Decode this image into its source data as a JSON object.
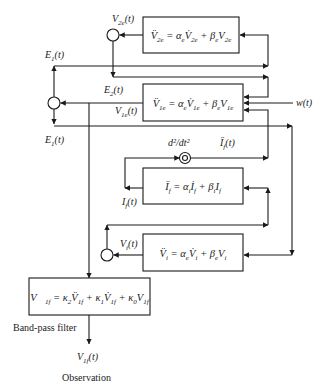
{
  "diagram": {
    "colors": {
      "line": "#1a1a1a",
      "background": "#ffffff"
    },
    "blocks": {
      "v2e": {
        "equation": [
          [
            "V̈",
            "2e"
          ],
          [
            " = α",
            "e"
          ],
          [
            "V̇",
            "2e"
          ],
          [
            " + β",
            "e"
          ],
          [
            "V",
            "2e"
          ]
        ]
      },
      "v1e": {
        "equation": [
          [
            "V̈",
            "1e"
          ],
          [
            " = α",
            "e"
          ],
          [
            "V̇",
            "1e"
          ],
          [
            " + β",
            "e"
          ],
          [
            "V",
            "1e"
          ]
        ]
      },
      "if": {
        "equation": [
          [
            "Ï",
            "f"
          ],
          [
            " = α",
            "i"
          ],
          [
            "İ",
            "f"
          ],
          [
            " + β",
            "i"
          ],
          [
            "I",
            "f"
          ]
        ]
      },
      "vi": {
        "equation": [
          [
            "V̈",
            "i"
          ],
          [
            " = α",
            "e"
          ],
          [
            "V̇",
            "i"
          ],
          [
            " + β",
            "e"
          ],
          [
            "V",
            "i"
          ]
        ]
      },
      "filter": {
        "equation": [
          [
            "V⃛",
            "1f"
          ],
          [
            " = κ",
            "2"
          ],
          [
            "V̈",
            "1f"
          ],
          [
            " + κ",
            "1"
          ],
          [
            "V̇",
            "1f"
          ],
          [
            " + κ",
            "0"
          ],
          [
            "V",
            "1f"
          ]
        ]
      }
    },
    "labels": {
      "v2e_out": [
        [
          "V",
          "2e"
        ],
        [
          "(t)",
          ""
        ]
      ],
      "e1_top": [
        [
          "E",
          "1"
        ],
        [
          "(t)",
          ""
        ]
      ],
      "e2": [
        [
          "E",
          "2"
        ],
        [
          "(t)",
          ""
        ]
      ],
      "v1e_out": [
        [
          "V",
          "1e"
        ],
        [
          "(t)",
          ""
        ]
      ],
      "e1_bottom": [
        [
          "E",
          "1"
        ],
        [
          "(t)",
          ""
        ]
      ],
      "d2dt2": "d²/dt²",
      "if_ddot": [
        [
          "Ï",
          "f"
        ],
        [
          "(t)",
          ""
        ]
      ],
      "if_out": [
        [
          "I",
          "f"
        ],
        [
          "(t)",
          ""
        ]
      ],
      "vi_out": [
        [
          "V",
          "i"
        ],
        [
          "(t)",
          ""
        ]
      ],
      "w": "w(t)",
      "band_pass": "Band-pass filter",
      "v1f_out": [
        [
          "V",
          "1f"
        ],
        [
          "(t)",
          ""
        ]
      ],
      "observation": "Observation"
    }
  }
}
